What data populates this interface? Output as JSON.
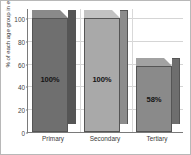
{
  "chart_data": {
    "type": "bar",
    "title": "",
    "subtitle": "",
    "xlabel": "",
    "ylabel": "% of each age group in education",
    "categories": [
      "Primary",
      "Secondary",
      "Tertiary"
    ],
    "values": [
      100,
      100,
      58
    ],
    "data_labels": [
      "100%",
      "100%",
      "58%"
    ],
    "ylim": [
      0,
      100
    ],
    "yticks": [
      0,
      20,
      40,
      60,
      80,
      100
    ],
    "ytick_labels": [
      "0",
      "20",
      "40",
      "60",
      "80",
      "100"
    ],
    "grid": true,
    "legend": false,
    "legend_position": "none",
    "series": [
      {
        "name": "% of each age group in education",
        "values": [
          100,
          100,
          58
        ]
      }
    ],
    "bar_colors": [
      "#6f6f6f",
      "#a9a9a9",
      "#8a8a8a"
    ],
    "bar_top_colors": [
      "#8a8a8a",
      "#c2c2c2",
      "#a2a2a2"
    ],
    "bar_side_colors": [
      "#555555",
      "#8c8c8c",
      "#6e6e6e"
    ],
    "style": "3d-column",
    "axis_color": "#7a7a7a",
    "grid_color": "#d5d5d5",
    "background": "#ffffff",
    "border_color": "#b8b8b8"
  }
}
